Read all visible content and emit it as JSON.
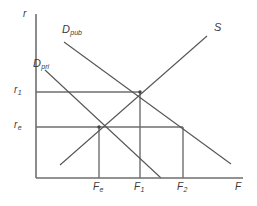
{
  "figure": {
    "type": "economics-supply-demand-diagram",
    "background_color": "#ffffff",
    "line_color": "#555555",
    "text_color": "#3a3a3a"
  },
  "axes": {
    "y_label": "r",
    "x_label": "F",
    "origin": {
      "x": 36,
      "y": 178
    },
    "y_axis_top": {
      "x": 36,
      "y": 14
    },
    "x_axis_right": {
      "x": 243,
      "y": 178
    }
  },
  "y_ticks": [
    {
      "name": "r-one",
      "base": "r",
      "subscript": "1",
      "y": 92
    },
    {
      "name": "r-e",
      "base": "r",
      "subscript": "e",
      "y": 127
    }
  ],
  "x_ticks": [
    {
      "name": "F-e",
      "base": "F",
      "subscript": "e",
      "x": 99
    },
    {
      "name": "F-one",
      "base": "F",
      "subscript": "1",
      "x": 140
    },
    {
      "name": "F-two",
      "base": "F",
      "subscript": "2",
      "x": 183
    }
  ],
  "curves": [
    {
      "name": "demand-public",
      "base": "D",
      "subscript": "pub",
      "label_x": 62,
      "label_y": 24,
      "x1": 64,
      "y1": 42,
      "x2": 231,
      "y2": 164
    },
    {
      "name": "demand-private",
      "base": "D",
      "subscript": "pri",
      "label_x": 33,
      "label_y": 58,
      "x1": 45,
      "y1": 70,
      "x2": 161,
      "y2": 178
    },
    {
      "name": "supply",
      "base": "S",
      "subscript": "",
      "label_x": 214,
      "label_y": 22,
      "x1": 60,
      "y1": 165,
      "x2": 207,
      "y2": 36
    }
  ],
  "guide_lines": [
    {
      "name": "r1-horizontal",
      "x1": 36,
      "y1": 92,
      "x2": 140,
      "y2": 92
    },
    {
      "name": "re-horizontal",
      "x1": 36,
      "y1": 127,
      "x2": 183,
      "y2": 127
    },
    {
      "name": "F1-vertical",
      "x1": 140,
      "y1": 92,
      "x2": 140,
      "y2": 178
    },
    {
      "name": "Fe-vertical",
      "x1": 99,
      "y1": 127,
      "x2": 99,
      "y2": 178
    },
    {
      "name": "F2-vertical",
      "x1": 183,
      "y1": 127,
      "x2": 183,
      "y2": 178
    }
  ],
  "intersections": [
    {
      "name": "equilibrium-private",
      "x": 99,
      "y": 127
    },
    {
      "name": "equilibrium-public",
      "x": 140,
      "y": 92
    }
  ],
  "chart_data": {
    "type": "line",
    "title": "",
    "xlabel": "F",
    "ylabel": "r",
    "grid": false,
    "legend_position": "inline-curve-labels",
    "series": [
      {
        "name": "D_pub",
        "role": "public demand",
        "slope": "negative"
      },
      {
        "name": "D_pri",
        "role": "private demand",
        "slope": "negative"
      },
      {
        "name": "S",
        "role": "supply",
        "slope": "positive"
      }
    ],
    "annotations": [
      "S intersects D_pri at (F_e, r_e)",
      "S intersects D_pub at (F_1, r_1)",
      "D_pub at r_e corresponds to F_2"
    ]
  }
}
